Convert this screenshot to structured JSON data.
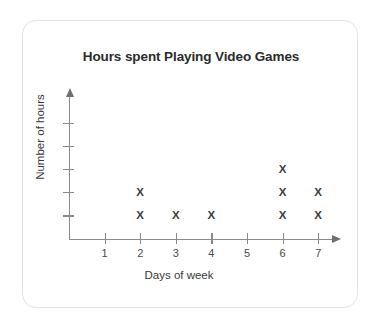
{
  "chart_data": {
    "type": "scatter",
    "title": "Hours spent Playing Video Games",
    "xlabel": "Days of week",
    "ylabel": "Number of hours",
    "marker": "X",
    "grid": false,
    "legend": null,
    "categories": [
      "1",
      "2",
      "3",
      "4",
      "5",
      "6",
      "7"
    ],
    "x": [
      1,
      2,
      3,
      4,
      5,
      6,
      7
    ],
    "values": [
      0,
      2,
      1,
      1,
      0,
      3,
      2
    ],
    "xlim": [
      0,
      7.6
    ],
    "ylim": [
      0,
      5.6
    ],
    "x_tick_labels": [
      "1",
      "2",
      "3",
      "4",
      "5",
      "6",
      "7"
    ],
    "y_tick_labels": [
      "",
      "",
      "",
      "",
      ""
    ],
    "y_tick_count": 5,
    "points": [
      {
        "x": 2,
        "y": 1
      },
      {
        "x": 2,
        "y": 2
      },
      {
        "x": 3,
        "y": 1
      },
      {
        "x": 4,
        "y": 1
      },
      {
        "x": 6,
        "y": 1
      },
      {
        "x": 6,
        "y": 2
      },
      {
        "x": 6,
        "y": 3
      },
      {
        "x": 7,
        "y": 1
      },
      {
        "x": 7,
        "y": 2
      }
    ]
  },
  "colors": {
    "card_background": "#ffffff",
    "card_border": "#e3e3e3",
    "title_text": "#2b2b2b",
    "axis_line": "#8a8a8a",
    "axis_label": "#3a3a3a",
    "tick_label": "#4a4a4a",
    "marker": "#3d3d3d"
  }
}
